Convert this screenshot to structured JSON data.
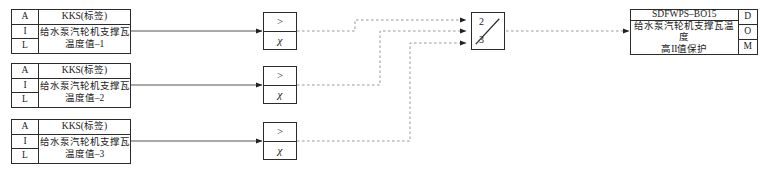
{
  "diagram": {
    "line_color": "#444444",
    "border_color": "#2b2b2b",
    "background": "#ffffff"
  },
  "input_blocks": [
    {
      "tags": [
        "A",
        "I",
        "L"
      ],
      "kks_label": "KKS(标签)",
      "desc_line1": "给水泵汽轮机支撑瓦",
      "desc_line2": "温度值–1"
    },
    {
      "tags": [
        "A",
        "I",
        "L"
      ],
      "kks_label": "KKS(标签)",
      "desc_line1": "给水泵汽轮机支撑瓦",
      "desc_line2": "温度值–2"
    },
    {
      "tags": [
        "A",
        "I",
        "L"
      ],
      "kks_label": "KKS(标签)",
      "desc_line1": "给水泵汽轮机支撑瓦",
      "desc_line2": "温度值–3"
    }
  ],
  "comparators": [
    {
      "operator": ">",
      "setpoint_symbol": "χ"
    },
    {
      "operator": ">",
      "setpoint_symbol": "χ"
    },
    {
      "operator": ">",
      "setpoint_symbol": "χ"
    }
  ],
  "voter": {
    "numerator": "2",
    "denominator": "3"
  },
  "output_block": {
    "tag_name": "SDFWPS–BO15",
    "desc_line1": "给水泵汽轮机支撑瓦温度",
    "desc_line2": "高II值保护",
    "tags": [
      "D",
      "O",
      "M"
    ]
  }
}
